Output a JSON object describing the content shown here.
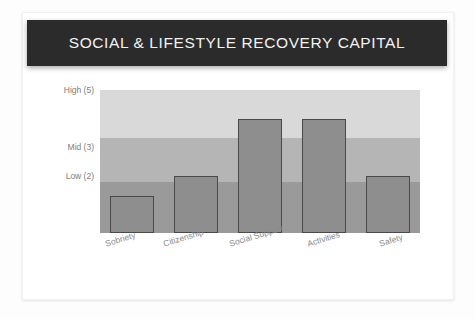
{
  "card": {
    "title": "SOCIAL & LIFESTYLE RECOVERY CAPITAL"
  },
  "colors": {
    "banner_background": "#2b2b2b",
    "banner_text": "#f2f2f2",
    "band_high": "#d9d9d9",
    "band_mid": "#b5b5b5",
    "band_low": "#9a9a9a",
    "bar_fill": "#8e8e8e",
    "bar_stroke": "#4a4a4a",
    "axis_text": "#7d7d7d",
    "card_background": "#ffffff",
    "page_background": "#fdfdfd"
  },
  "chart_data": {
    "type": "bar",
    "title": "SOCIAL & LIFESTYLE RECOVERY CAPITAL",
    "xlabel": "",
    "ylabel": "",
    "categories": [
      "Sobriety",
      "Citizenship",
      "Social Support",
      "Activities",
      "Safety"
    ],
    "values": [
      1.3,
      2.0,
      4.0,
      4.0,
      2.0
    ],
    "ylim": [
      0,
      5
    ],
    "grid": false,
    "legend": "none",
    "ytick_values": [
      5,
      3,
      2
    ],
    "ytick_labels": [
      "High (5)",
      "Mid (3)",
      "Low (2)"
    ],
    "bands": [
      {
        "name": "high-band",
        "from": 3,
        "to": 5,
        "color": "#d9d9d9"
      },
      {
        "name": "mid-band",
        "from": 2,
        "to": 3,
        "color": "#b5b5b5"
      },
      {
        "name": "low-band",
        "from": 0,
        "to": 2,
        "color": "#9a9a9a"
      }
    ],
    "bars": [
      {
        "category": "Sobriety",
        "value": 1.3
      },
      {
        "category": "Citizenship",
        "value": 2.0
      },
      {
        "category": "Social Support",
        "value": 4.0
      },
      {
        "category": "Activities",
        "value": 4.0
      },
      {
        "category": "Safety",
        "value": 2.0
      }
    ]
  }
}
